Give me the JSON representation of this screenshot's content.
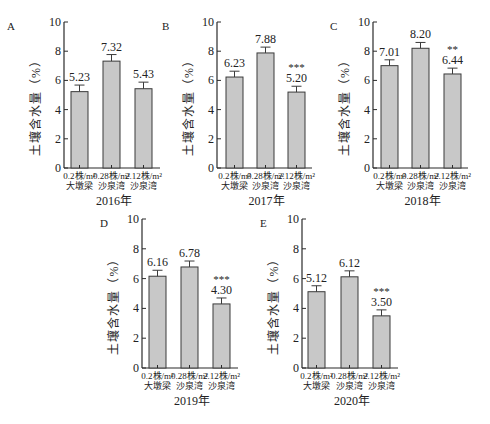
{
  "figure": {
    "bar_fill": "#c8c8c8",
    "bar_stroke": "#3a3a3a",
    "axis_color": "#2a2a2a"
  },
  "chart_data": [
    {
      "panel": "A",
      "type": "bar",
      "title": "2016年",
      "xlabel": "2016年",
      "ylabel": "土壤含水量（%）",
      "ylim": [
        0,
        10
      ],
      "yticks": [
        0,
        2,
        4,
        6,
        8,
        10
      ],
      "grid": false,
      "categories": [
        "0.2株/m² 大墩梁",
        "0.28株/m² 沙泉湾",
        "2.12株/m² 沙泉湾"
      ],
      "category_lines": [
        [
          "0.2株/m²",
          "大墩梁"
        ],
        [
          "0.28株/m²",
          "沙泉湾"
        ],
        [
          "2.12株/m²",
          "沙泉湾"
        ]
      ],
      "values": [
        5.23,
        7.32,
        5.43
      ],
      "value_labels": [
        "5.23",
        "7.32",
        "5.43"
      ],
      "errors": [
        0.45,
        0.45,
        0.45
      ],
      "significance": [
        "",
        "",
        ""
      ]
    },
    {
      "panel": "B",
      "type": "bar",
      "title": "2017年",
      "xlabel": "2017年",
      "ylabel": "土壤含水量（%）",
      "ylim": [
        0,
        10
      ],
      "yticks": [
        0,
        2,
        4,
        6,
        8,
        10
      ],
      "grid": false,
      "categories": [
        "0.2株/m² 大墩梁",
        "0.28株/m² 沙泉湾",
        "2.12株/m² 沙泉湾"
      ],
      "category_lines": [
        [
          "0.2株/m²",
          "大墩梁"
        ],
        [
          "0.28株/m²",
          "沙泉湾"
        ],
        [
          "2.12株/m²",
          "沙泉湾"
        ]
      ],
      "values": [
        6.23,
        7.88,
        5.2
      ],
      "value_labels": [
        "6.23",
        "7.88",
        "5.20"
      ],
      "errors": [
        0.4,
        0.4,
        0.4
      ],
      "significance": [
        "",
        "",
        "***"
      ]
    },
    {
      "panel": "C",
      "type": "bar",
      "title": "2018年",
      "xlabel": "2018年",
      "ylabel": "土壤含水量（%）",
      "ylim": [
        0,
        10
      ],
      "yticks": [
        0,
        2,
        4,
        6,
        8,
        10
      ],
      "grid": false,
      "categories": [
        "0.2株/m² 大墩梁",
        "0.28株/m² 沙泉湾",
        "2.12株/m² 沙泉湾"
      ],
      "category_lines": [
        [
          "0.2株/m²",
          "大墩梁"
        ],
        [
          "0.28株/m²",
          "沙泉湾"
        ],
        [
          "2.12株/m²",
          "沙泉湾"
        ]
      ],
      "values": [
        7.01,
        8.2,
        6.44
      ],
      "value_labels": [
        "7.01",
        "8.20",
        "6.44"
      ],
      "errors": [
        0.4,
        0.4,
        0.4
      ],
      "significance": [
        "",
        "",
        "**"
      ]
    },
    {
      "panel": "D",
      "type": "bar",
      "title": "2019年",
      "xlabel": "2019年",
      "ylabel": "土壤含水量（%）",
      "ylim": [
        0,
        10
      ],
      "yticks": [
        0,
        2,
        4,
        6,
        8,
        10
      ],
      "grid": false,
      "categories": [
        "0.2株/m² 大墩梁",
        "0.28株/m² 沙泉湾",
        "2.12株/m² 沙泉湾"
      ],
      "category_lines": [
        [
          "0.2株/m²",
          "大墩梁"
        ],
        [
          "0.28株/m²",
          "沙泉湾"
        ],
        [
          "2.12株/m²",
          "沙泉湾"
        ]
      ],
      "values": [
        6.16,
        6.78,
        4.3
      ],
      "value_labels": [
        "6.16",
        "6.78",
        "4.30"
      ],
      "errors": [
        0.4,
        0.4,
        0.4
      ],
      "significance": [
        "",
        "",
        "***"
      ]
    },
    {
      "panel": "E",
      "type": "bar",
      "title": "2020年",
      "xlabel": "2020年",
      "ylabel": "土壤含水量（%）",
      "ylim": [
        0,
        10
      ],
      "yticks": [
        0,
        2,
        4,
        6,
        8,
        10
      ],
      "grid": false,
      "categories": [
        "0.2株/m² 大墩梁",
        "0.28株/m² 沙泉湾",
        "2.12株/m² 沙泉湾"
      ],
      "category_lines": [
        [
          "0.2株/m²",
          "大墩梁"
        ],
        [
          "0.28株/m²",
          "沙泉湾"
        ],
        [
          "2.12株/m²",
          "沙泉湾"
        ]
      ],
      "values": [
        5.12,
        6.12,
        3.5
      ],
      "value_labels": [
        "5.12",
        "6.12",
        "3.50"
      ],
      "errors": [
        0.4,
        0.4,
        0.4
      ],
      "significance": [
        "",
        "",
        "***"
      ]
    }
  ]
}
